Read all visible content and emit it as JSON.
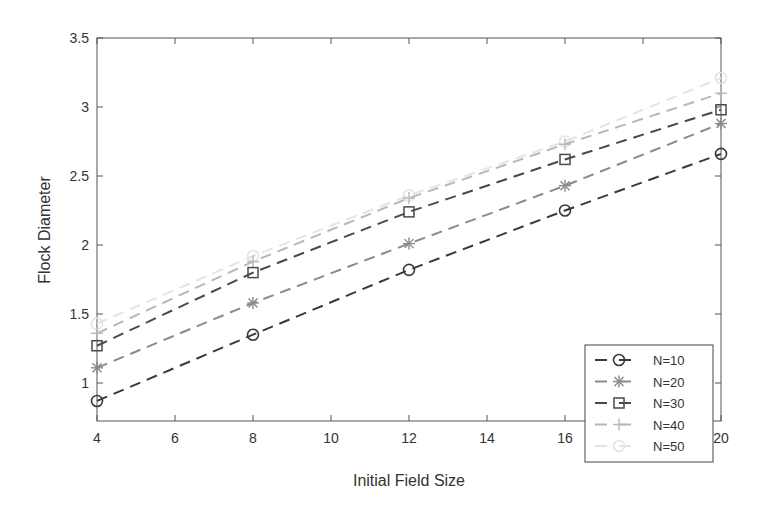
{
  "chart_data": {
    "type": "line",
    "title": "",
    "xlabel": "Initial Field Size",
    "ylabel": "Flock Diameter",
    "x": [
      4,
      8,
      12,
      16,
      20
    ],
    "xlim": [
      4,
      20
    ],
    "ylim": [
      0.6,
      3.5
    ],
    "xticks": [
      4,
      6,
      8,
      10,
      12,
      14,
      16,
      18,
      20
    ],
    "yticks": [
      1,
      1.5,
      2,
      2.5,
      3,
      3.5
    ],
    "ytick_labels": [
      "1",
      "1.5",
      "2",
      "2.5",
      "3",
      "3.5"
    ],
    "grid": false,
    "legend_position": "lower right",
    "series": [
      {
        "name": "N=10",
        "marker": "circle",
        "color": "#3a3a3a",
        "values": [
          0.87,
          1.35,
          1.82,
          2.25,
          2.66
        ]
      },
      {
        "name": "N=20",
        "marker": "asterisk",
        "color": "#8a8a8a",
        "values": [
          1.11,
          1.58,
          2.01,
          2.43,
          2.88
        ]
      },
      {
        "name": "N=30",
        "marker": "square",
        "color": "#4a4a4a",
        "values": [
          1.27,
          1.8,
          2.24,
          2.62,
          2.98
        ]
      },
      {
        "name": "N=40",
        "marker": "plus",
        "color": "#b8b8b8",
        "values": [
          1.36,
          1.88,
          2.34,
          2.73,
          3.1
        ]
      },
      {
        "name": "N=50",
        "marker": "circle",
        "color": "#e4e4e4",
        "values": [
          1.43,
          1.92,
          2.36,
          2.75,
          3.21
        ]
      }
    ]
  }
}
